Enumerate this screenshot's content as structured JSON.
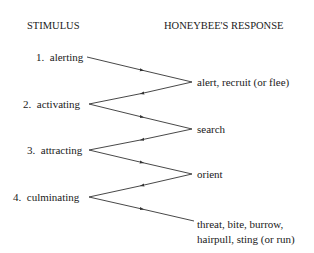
{
  "headers": {
    "stimulus": "STIMULUS",
    "response": "HONEYBEE'S RESPONSE"
  },
  "stimuli": [
    {
      "number": "1.",
      "label": "alerting"
    },
    {
      "number": "2.",
      "label": "activating"
    },
    {
      "number": "3.",
      "label": "attracting"
    },
    {
      "number": "4.",
      "label": "culminating"
    }
  ],
  "responses": [
    {
      "label": "alert, recruit (or flee)"
    },
    {
      "label": "search"
    },
    {
      "label": "orient"
    },
    {
      "line1": "threat, bite, burrow,",
      "line2": "hairpull, sting (or run)"
    }
  ],
  "colors": {
    "line": "#333333",
    "text": "#1a1a1a",
    "background": "#ffffff"
  }
}
